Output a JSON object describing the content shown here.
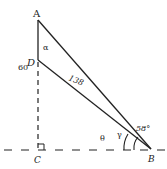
{
  "diagram": {
    "points": {
      "A": {
        "label": "A",
        "x": 38,
        "y": 20
      },
      "D": {
        "label": "D",
        "x": 38,
        "y": 60
      },
      "C": {
        "label": "C",
        "x": 38,
        "y": 150
      },
      "B": {
        "label": "B",
        "x": 151,
        "y": 149
      }
    },
    "segments": {
      "AD": {
        "label": "60"
      },
      "DB": {
        "label": "138"
      }
    },
    "angles": {
      "alpha": {
        "label": "α"
      },
      "gamma": {
        "label": "γ"
      },
      "theta": {
        "label": "θ"
      },
      "b_angle": {
        "label": "58°"
      }
    },
    "colors": {
      "ink": "#222222",
      "background": "#ffffff"
    }
  }
}
